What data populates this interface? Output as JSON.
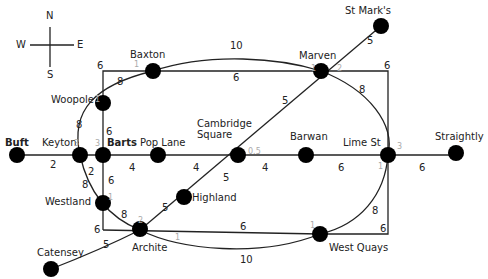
{
  "compass": {
    "n": "N",
    "s": "S",
    "e": "E",
    "w": "W"
  },
  "stations": [
    {
      "id": "buft",
      "name": "Buft",
      "x": 17,
      "y": 155,
      "lx": 5,
      "ly": 137,
      "bold": true
    },
    {
      "id": "keyton",
      "name": "Keyton",
      "x": 80,
      "y": 155,
      "lx": 42,
      "ly": 137
    },
    {
      "id": "barts",
      "name": "Barts",
      "x": 103,
      "y": 155,
      "lx": 107,
      "ly": 137,
      "bold": true
    },
    {
      "id": "pop-lane",
      "name": "Pop Lane",
      "x": 158,
      "y": 155,
      "lx": 140,
      "ly": 137
    },
    {
      "id": "cambridge-square",
      "name": "Cambridge\nSquare",
      "x": 238,
      "y": 155,
      "lx": 197,
      "ly": 118
    },
    {
      "id": "barwan",
      "name": "Barwan",
      "x": 306,
      "y": 155,
      "lx": 290,
      "ly": 131
    },
    {
      "id": "lime-st",
      "name": "Lime St",
      "x": 388,
      "y": 155,
      "lx": 343,
      "ly": 137
    },
    {
      "id": "straightly",
      "name": "Straightly",
      "x": 456,
      "y": 153,
      "lx": 435,
      "ly": 131
    },
    {
      "id": "woopole",
      "name": "Woopole",
      "x": 103,
      "y": 103,
      "lx": 51,
      "ly": 94
    },
    {
      "id": "baxton",
      "name": "Baxton",
      "x": 153,
      "y": 71,
      "lx": 130,
      "ly": 49
    },
    {
      "id": "marven",
      "name": "Marven",
      "x": 321,
      "y": 71,
      "lx": 299,
      "ly": 50
    },
    {
      "id": "st-marks",
      "name": "St Mark's",
      "x": 381,
      "y": 26,
      "lx": 345,
      "ly": 5
    },
    {
      "id": "westland",
      "name": "Westland",
      "x": 103,
      "y": 203,
      "lx": 45,
      "ly": 196
    },
    {
      "id": "archite",
      "name": "Archite",
      "x": 140,
      "y": 229,
      "lx": 132,
      "ly": 242
    },
    {
      "id": "highland",
      "name": "Highland",
      "x": 184,
      "y": 197,
      "lx": 192,
      "ly": 192
    },
    {
      "id": "west-quays",
      "name": "West Quays",
      "x": 320,
      "y": 234,
      "lx": 329,
      "ly": 242
    },
    {
      "id": "catensey",
      "name": "Catensey",
      "x": 51,
      "y": 269,
      "lx": 37,
      "ly": 247
    }
  ],
  "weights": [
    {
      "t": "10",
      "x": 230,
      "y": 41
    },
    {
      "t": "6",
      "x": 233,
      "y": 73
    },
    {
      "t": "6",
      "x": 97,
      "y": 61
    },
    {
      "t": "8",
      "x": 117,
      "y": 77
    },
    {
      "t": "5",
      "x": 367,
      "y": 36
    },
    {
      "t": "6",
      "x": 384,
      "y": 61
    },
    {
      "t": "8",
      "x": 359,
      "y": 85
    },
    {
      "t": "5",
      "x": 282,
      "y": 96
    },
    {
      "t": "8",
      "x": 76,
      "y": 120
    },
    {
      "t": "6",
      "x": 106,
      "y": 127
    },
    {
      "t": "2",
      "x": 50,
      "y": 160
    },
    {
      "t": "2",
      "x": 88,
      "y": 167
    },
    {
      "t": "6",
      "x": 108,
      "y": 176
    },
    {
      "t": "8",
      "x": 82,
      "y": 180
    },
    {
      "t": "4",
      "x": 129,
      "y": 163
    },
    {
      "t": "4",
      "x": 193,
      "y": 163
    },
    {
      "t": "4",
      "x": 262,
      "y": 163
    },
    {
      "t": "6",
      "x": 338,
      "y": 163
    },
    {
      "t": "6",
      "x": 419,
      "y": 163
    },
    {
      "t": "5",
      "x": 223,
      "y": 173
    },
    {
      "t": "5",
      "x": 162,
      "y": 203
    },
    {
      "t": "8",
      "x": 121,
      "y": 210
    },
    {
      "t": "6",
      "x": 94,
      "y": 225
    },
    {
      "t": "5",
      "x": 103,
      "y": 240
    },
    {
      "t": "6",
      "x": 240,
      "y": 222
    },
    {
      "t": "6",
      "x": 380,
      "y": 224
    },
    {
      "t": "8",
      "x": 372,
      "y": 206
    },
    {
      "t": "10",
      "x": 240,
      "y": 255
    }
  ],
  "ports": [
    {
      "t": "1",
      "x": 134,
      "y": 61
    },
    {
      "t": "1",
      "x": 95,
      "y": 96
    },
    {
      "t": "1",
      "x": 311,
      "y": 65
    },
    {
      "t": "2",
      "x": 337,
      "y": 65
    },
    {
      "t": "3",
      "x": 74,
      "y": 140
    },
    {
      "t": "3",
      "x": 95,
      "y": 140
    },
    {
      "t": "0.5",
      "x": 248,
      "y": 148
    },
    {
      "t": "3",
      "x": 397,
      "y": 143
    },
    {
      "t": "1",
      "x": 378,
      "y": 163
    },
    {
      "t": "1",
      "x": 108,
      "y": 194
    },
    {
      "t": "2",
      "x": 138,
      "y": 217
    },
    {
      "t": "1",
      "x": 175,
      "y": 234
    },
    {
      "t": "1",
      "x": 310,
      "y": 222
    }
  ]
}
